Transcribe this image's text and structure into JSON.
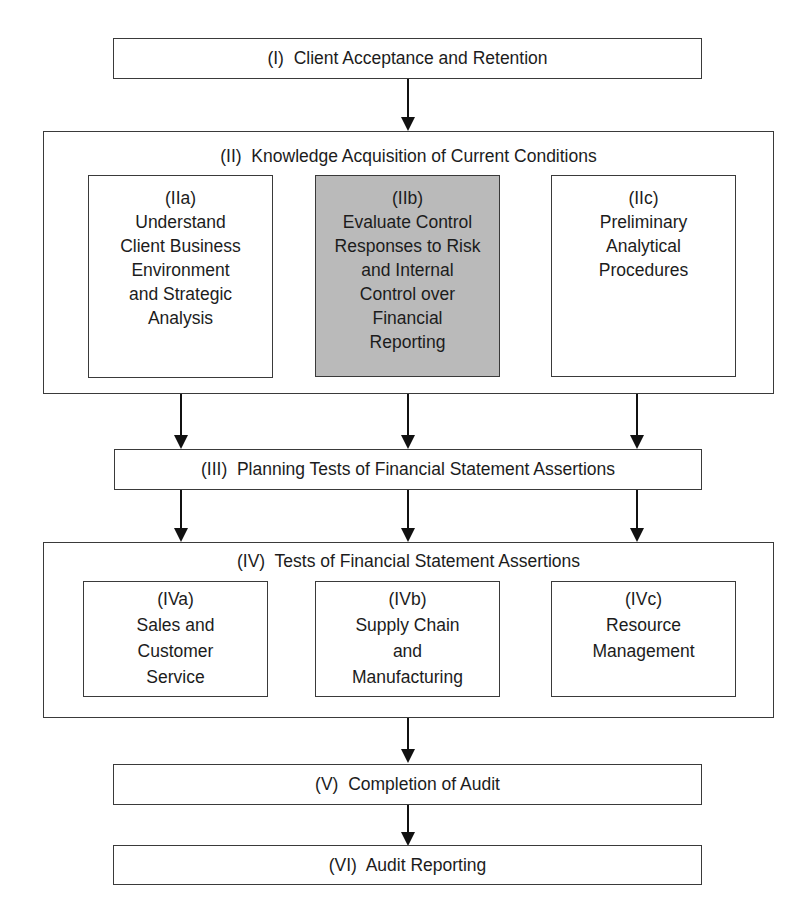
{
  "diagram": {
    "type": "audit-process-flowchart",
    "highlight_color": "#bababa",
    "stages": {
      "I": {
        "label": "(I)  Client Acceptance and Retention"
      },
      "II": {
        "label": "(II)  Knowledge Acquisition of Current Conditions",
        "substeps": [
          {
            "id": "IIa",
            "lines": [
              "(IIa)",
              "Understand",
              "Client Business",
              "Environment",
              "and Strategic",
              "Analysis"
            ],
            "highlighted": false
          },
          {
            "id": "IIb",
            "lines": [
              "(IIb)",
              "Evaluate Control",
              "Responses to Risk",
              "and Internal",
              "Control over",
              "Financial",
              "Reporting"
            ],
            "highlighted": true
          },
          {
            "id": "IIc",
            "lines": [
              "(IIc)",
              "Preliminary",
              "Analytical",
              "Procedures"
            ],
            "highlighted": false
          }
        ]
      },
      "III": {
        "label": "(III)  Planning Tests of Financial Statement Assertions"
      },
      "IV": {
        "label": "(IV)  Tests of Financial Statement Assertions",
        "substeps": [
          {
            "id": "IVa",
            "lines": [
              "(IVa)",
              "Sales and",
              "Customer",
              "Service"
            ],
            "highlighted": false
          },
          {
            "id": "IVb",
            "lines": [
              "(IVb)",
              "Supply Chain",
              "and",
              "Manufacturing"
            ],
            "highlighted": false
          },
          {
            "id": "IVc",
            "lines": [
              "(IVc)",
              "Resource",
              "Management"
            ],
            "highlighted": false
          }
        ]
      },
      "V": {
        "label": "(V)  Completion of Audit"
      },
      "VI": {
        "label": "(VI)  Audit Reporting"
      }
    },
    "edges": [
      [
        "I",
        "II"
      ],
      [
        "IIa",
        "III"
      ],
      [
        "IIb",
        "III"
      ],
      [
        "IIc",
        "III"
      ],
      [
        "III",
        "IVa"
      ],
      [
        "III",
        "IVb"
      ],
      [
        "III",
        "IVc"
      ],
      [
        "IV",
        "V"
      ],
      [
        "V",
        "VI"
      ]
    ]
  }
}
